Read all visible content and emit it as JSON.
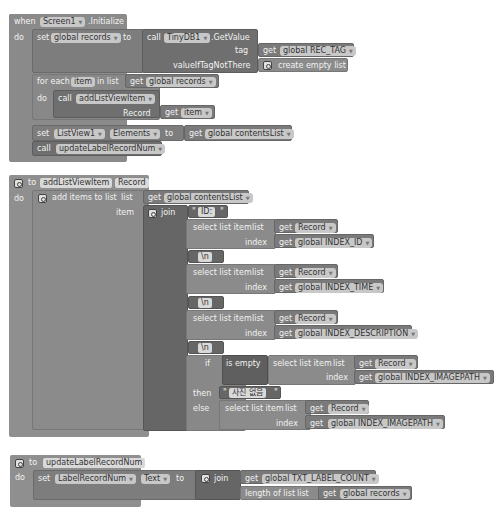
{
  "event_block": {
    "when": "when",
    "component": "Screen1",
    "event": ".Initialize",
    "do": "do",
    "set_label": "set",
    "set_var": "global records",
    "to": "to",
    "call": "call",
    "db_component": "TinyDB1",
    "db_method": ".GetValue",
    "tag_label": "tag",
    "get": "get",
    "tag_var": "global REC_TAG",
    "value_label": "valueIfTagNotThere",
    "create_empty_list": "create empty list",
    "for_each": "for each",
    "item_var": "item",
    "in_list": "in list",
    "list_var": "global records",
    "loop_do": "do",
    "loop_call": "call",
    "loop_proc": "addListViewItem",
    "record_param": "Record",
    "item_get": "item",
    "set2_label": "set",
    "listview": "ListView1",
    "elements": "Elements",
    "to2": "to",
    "contents_var": "global contentsList",
    "call2": "call",
    "update_proc": "updateLabelRecordNum"
  },
  "proc_add": {
    "to": "to",
    "name": "addListViewItem",
    "param": "Record",
    "do": "do",
    "add_items": "add items to list",
    "list_label": "list",
    "get": "get",
    "contents_var": "global contentsList",
    "item_label": "item",
    "join": "join",
    "str_id": "ID:",
    "select_list_item": "select list item",
    "list": "list",
    "index": "index",
    "record": "Record",
    "index_id": "global INDEX_ID",
    "str_nl": "\\n",
    "index_time": "global INDEX_TIME",
    "index_desc": "global INDEX_DESCRIPTION",
    "if": "if",
    "is_empty": "is empty",
    "index_image": "global INDEX_IMAGEPATH",
    "then": "then",
    "no_photo": "사진 없음",
    "else": "else"
  },
  "proc_update": {
    "to": "to",
    "name": "updateLabelRecordNum",
    "do": "do",
    "set": "set",
    "component": "LabelRecordNum",
    "property": "Text",
    "to2": "to",
    "join": "join",
    "get": "get",
    "count_var": "global TXT_LABEL_COUNT",
    "length_of_list": "length of list",
    "list": "list",
    "records_var": "global records"
  },
  "colors": {
    "event": "#8a8a8a",
    "procedure": "#8f8f8f",
    "dropdown": "#c8c8c8",
    "background": "#ffffff"
  }
}
